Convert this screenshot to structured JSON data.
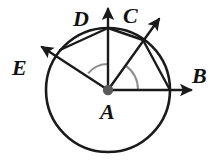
{
  "figure": {
    "kind": "geometry-diagram",
    "background_color": "#ffffff",
    "stroke_color": "#1a1a1a",
    "arc_color": "#8e8e8e",
    "center_dot_color": "#5a5a5a",
    "circle": {
      "center_x": 108,
      "center_y": 90,
      "radius": 62,
      "stroke_width": 2.6
    },
    "center_point": {
      "name": "A",
      "x": 108,
      "y": 90,
      "dot_radius": 5.2
    },
    "rays": [
      {
        "name": "AB",
        "endpoint_label": "B",
        "angle_degrees": 0,
        "tip_x": 191,
        "tip_y": 90,
        "circle_x": 170,
        "circle_y": 90,
        "stroke_width": 2.4
      },
      {
        "name": "AC",
        "endpoint_label": "C",
        "angle_degrees": 55,
        "tip_x": 159,
        "tip_y": 19,
        "circle_x": 143,
        "circle_y": 40,
        "stroke_width": 2.4
      },
      {
        "name": "AD",
        "endpoint_label": "D",
        "angle_degrees": 90,
        "tip_x": 108,
        "tip_y": 9,
        "circle_x": 108,
        "circle_y": 28,
        "stroke_width": 2.4
      },
      {
        "name": "AE",
        "endpoint_label": "E",
        "angle_degrees": 140,
        "tip_x": 42,
        "tip_y": 47,
        "circle_x": 60,
        "circle_y": 50,
        "stroke_width": 2.4
      }
    ],
    "chords": [
      {
        "name": "chord-ED",
        "from": "E",
        "to": "D",
        "x1": 60,
        "y1": 50,
        "x2": 108,
        "y2": 28
      },
      {
        "name": "chord-DC",
        "from": "D",
        "to": "C",
        "x1": 108,
        "y1": 28,
        "x2": 143,
        "y2": 40
      },
      {
        "name": "chord-CB",
        "from": "C",
        "to": "B",
        "x1": 143,
        "y1": 40,
        "x2": 170,
        "y2": 90
      }
    ],
    "angle_arcs": [
      {
        "name": "angle-arc-EAD",
        "between": [
          "E",
          "D"
        ],
        "radius": 26,
        "start_angle_degrees": 90,
        "end_angle_degrees": 140
      },
      {
        "name": "angle-arc-BAC",
        "between": [
          "B",
          "C"
        ],
        "radius": 30,
        "start_angle_degrees": 0,
        "end_angle_degrees": 55
      }
    ],
    "labels": [
      {
        "name": "label-A",
        "text": "A",
        "x": 100,
        "y": 101,
        "font_size": 22
      },
      {
        "name": "label-B",
        "text": "B",
        "x": 192,
        "y": 65,
        "font_size": 22
      },
      {
        "name": "label-C",
        "text": "C",
        "x": 123,
        "y": 5,
        "font_size": 22
      },
      {
        "name": "label-D",
        "text": "D",
        "x": 73,
        "y": 8,
        "font_size": 22
      },
      {
        "name": "label-E",
        "text": "E",
        "x": 12,
        "y": 57,
        "font_size": 22
      }
    ]
  }
}
